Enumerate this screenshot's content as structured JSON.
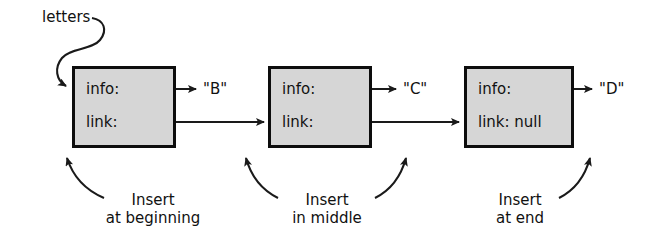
{
  "diagram": {
    "title_label": "letters",
    "nodes": [
      {
        "id": "node-b",
        "info_label": "info:",
        "link_label": "link:",
        "value": "\"B\"",
        "caption_line1": "Insert",
        "caption_line2": "at beginning"
      },
      {
        "id": "node-c",
        "info_label": "info:",
        "link_label": "link:",
        "value": "\"C\"",
        "caption_line1": "Insert",
        "caption_line2": "in middle"
      },
      {
        "id": "node-d",
        "info_label": "info:",
        "link_label": "link: null",
        "value": "\"D\"",
        "caption_line1": "Insert",
        "caption_line2": "at end"
      }
    ],
    "colors": {
      "box_fill": "#d6d6d6",
      "box_stroke": "#0d0d0d",
      "line": "#1a1a1a",
      "text": "#111111",
      "background": "#ffffff"
    }
  }
}
